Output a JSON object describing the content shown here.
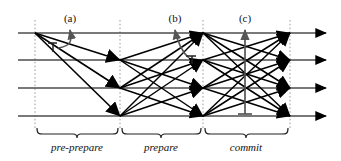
{
  "figure": {
    "background_color": "#ffffff",
    "line_color": "#4d4d4d",
    "arrow_color": "#000000",
    "dash_color": "#999999",
    "text_color": "#111111",
    "width": 341,
    "height": 161
  },
  "participants": [
    {
      "id": "replica-0",
      "row": 0,
      "y": 33
    },
    {
      "id": "replica-1",
      "row": 1,
      "y": 60
    },
    {
      "id": "replica-2",
      "row": 2,
      "y": 88
    },
    {
      "id": "replica-3",
      "row": 3,
      "y": 116
    }
  ],
  "stage_lines": [
    {
      "id": "stage-line-1",
      "x": 35
    },
    {
      "id": "stage-line-2",
      "x": 120
    },
    {
      "id": "stage-line-3",
      "x": 203
    },
    {
      "id": "stage-line-4",
      "x": 290
    }
  ],
  "phases": [
    {
      "id": "pre-prepare",
      "label": "pre-prepare",
      "x_start": 35,
      "x_end": 120,
      "label_x": 77,
      "label_y": 147
    },
    {
      "id": "prepare",
      "label": "prepare",
      "x_start": 120,
      "x_end": 203,
      "label_x": 161,
      "label_y": 147
    },
    {
      "id": "commit",
      "label": "commit",
      "x_start": 203,
      "x_end": 290,
      "label_x": 246,
      "label_y": 147
    }
  ],
  "point_labels": [
    {
      "id": "label-a",
      "text": "(a)",
      "x": 70,
      "y": 22,
      "marker_x": 70,
      "marker_from_row": 0
    },
    {
      "id": "label-b",
      "text": "(b)",
      "x": 175,
      "y": 22,
      "marker_x": 175,
      "marker_from_row": 0
    },
    {
      "id": "label-c",
      "text": "(c)",
      "x": 245,
      "y": 22,
      "marker_x": 245,
      "marker_from_row": 3
    }
  ],
  "messages": {
    "pre_prepare": [
      {
        "from_row": 0,
        "to_row": 1,
        "x1": 35,
        "x2": 120
      },
      {
        "from_row": 0,
        "to_row": 2,
        "x1": 35,
        "x2": 120
      },
      {
        "from_row": 0,
        "to_row": 3,
        "x1": 35,
        "x2": 120
      }
    ],
    "prepare": [
      {
        "from_row": 1,
        "to_row": 0,
        "x1": 120,
        "x2": 203
      },
      {
        "from_row": 1,
        "to_row": 2,
        "x1": 120,
        "x2": 203
      },
      {
        "from_row": 1,
        "to_row": 3,
        "x1": 120,
        "x2": 203
      },
      {
        "from_row": 2,
        "to_row": 0,
        "x1": 120,
        "x2": 203
      },
      {
        "from_row": 2,
        "to_row": 1,
        "x1": 120,
        "x2": 203
      },
      {
        "from_row": 2,
        "to_row": 3,
        "x1": 120,
        "x2": 203
      },
      {
        "from_row": 3,
        "to_row": 0,
        "x1": 120,
        "x2": 203
      },
      {
        "from_row": 3,
        "to_row": 1,
        "x1": 120,
        "x2": 203
      },
      {
        "from_row": 3,
        "to_row": 2,
        "x1": 120,
        "x2": 203
      }
    ],
    "commit": [
      {
        "from_row": 0,
        "to_row": 1,
        "x1": 203,
        "x2": 290
      },
      {
        "from_row": 0,
        "to_row": 2,
        "x1": 203,
        "x2": 290
      },
      {
        "from_row": 0,
        "to_row": 3,
        "x1": 203,
        "x2": 290
      },
      {
        "from_row": 1,
        "to_row": 0,
        "x1": 203,
        "x2": 290
      },
      {
        "from_row": 1,
        "to_row": 2,
        "x1": 203,
        "x2": 290
      },
      {
        "from_row": 1,
        "to_row": 3,
        "x1": 203,
        "x2": 290
      },
      {
        "from_row": 2,
        "to_row": 0,
        "x1": 203,
        "x2": 290
      },
      {
        "from_row": 2,
        "to_row": 1,
        "x1": 203,
        "x2": 290
      },
      {
        "from_row": 2,
        "to_row": 3,
        "x1": 203,
        "x2": 290
      },
      {
        "from_row": 3,
        "to_row": 0,
        "x1": 203,
        "x2": 290
      },
      {
        "from_row": 3,
        "to_row": 1,
        "x1": 203,
        "x2": 290
      },
      {
        "from_row": 3,
        "to_row": 2,
        "x1": 203,
        "x2": 290
      }
    ]
  },
  "timeline": {
    "x_start": 18,
    "x_end": 332,
    "arrow_tip_x": 332
  },
  "stubs": [
    {
      "id": "stub-a",
      "x": 53,
      "row": 0,
      "height": 12
    },
    {
      "id": "stub-b",
      "x": 192,
      "row": 1,
      "height": 12
    }
  ],
  "braces": [
    {
      "id": "brace-pre-prepare",
      "x_start": 35,
      "x_end": 120,
      "y": 132
    },
    {
      "id": "brace-prepare",
      "x_start": 120,
      "x_end": 203,
      "y": 132
    },
    {
      "id": "brace-commit",
      "x_start": 203,
      "x_end": 290,
      "y": 132
    }
  ]
}
